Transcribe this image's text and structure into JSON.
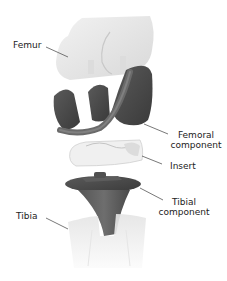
{
  "figure": {
    "colors": {
      "background": "#ffffff",
      "bone": "#e6e6e6",
      "bone_shadow": "#d2d2d2",
      "metal_dark": "#4a4a4a",
      "metal_mid": "#666666",
      "insert": "#f0f0f0",
      "leader_line": "#555555",
      "text": "#222222"
    },
    "labels": {
      "femur": "Femur",
      "femoral_component_line1": "Femoral",
      "femoral_component_line2": "component",
      "insert": "Insert",
      "tibial_component_line1": "Tibial",
      "tibial_component_line2": "component",
      "tibia": "Tibia"
    }
  }
}
